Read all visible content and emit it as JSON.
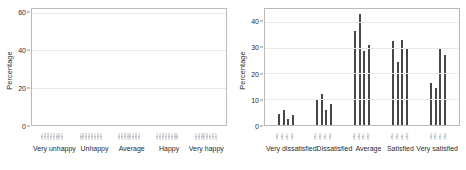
{
  "chart_data": [
    {
      "type": "bar",
      "panel": "left",
      "title": "",
      "xlabel": "",
      "ylabel": "Percentage",
      "ylim": [
        0,
        62
      ],
      "yticks": [
        0,
        20,
        40,
        60
      ],
      "grid": true,
      "legend": "none",
      "categories": [
        "Very unhappy",
        "Unhappy",
        "Average",
        "Happy",
        "Very happy"
      ],
      "bars_per_group": 8,
      "bar_labels": [
        "2002",
        "2003",
        "2004",
        "2005",
        "2006",
        "2007",
        "2008",
        "2009"
      ],
      "groups": [
        {
          "category": "Very unhappy",
          "values": [
            1.0,
            1.5,
            1.2,
            2.5,
            2.2,
            2.0,
            1.5,
            1.3
          ]
        },
        {
          "category": "Unhappy",
          "values": [
            8.6,
            7.6,
            11.7,
            8.7,
            8.1,
            7.2,
            8.4,
            7.0
          ]
        },
        {
          "category": "Average",
          "values": [
            46.0,
            48.0,
            26.5,
            18.3,
            11.1,
            15.8,
            17.8,
            15.0
          ]
        },
        {
          "category": "Happy",
          "values": [
            39.8,
            40.5,
            38.8,
            55.0,
            59.0,
            58.6,
            58.6,
            59.0
          ]
        },
        {
          "category": "Very happy",
          "values": [
            4.2,
            18.8,
            14.8,
            20.0,
            15.5,
            14.2,
            17.0,
            16.8
          ]
        }
      ]
    },
    {
      "type": "bar",
      "panel": "right",
      "title": "",
      "xlabel": "",
      "ylabel": "Percentage",
      "ylim": [
        0,
        45
      ],
      "yticks": [
        0,
        10,
        20,
        30,
        40
      ],
      "grid": true,
      "legend": "none",
      "categories": [
        "Very dissatisfied",
        "Dissatisfied",
        "Average",
        "Satisfied",
        "Very satisfied"
      ],
      "bars_per_group": 5,
      "bar_labels": [
        "2005",
        "2006",
        "2007",
        "2008",
        "2009"
      ],
      "groups": [
        {
          "category": "Very dissatisfied",
          "values": [
            4.2,
            5.8,
            2.5,
            4.0,
            0.0
          ]
        },
        {
          "category": "Dissatisfied",
          "values": [
            10.1,
            12.1,
            6.0,
            8.2,
            0.0
          ]
        },
        {
          "category": "Average",
          "values": [
            36.3,
            43.0,
            28.7,
            31.0,
            0.0
          ]
        },
        {
          "category": "Satisfied",
          "values": [
            32.6,
            24.4,
            33.0,
            29.4,
            0.0
          ]
        },
        {
          "category": "Very satisfied",
          "values": [
            16.2,
            14.2,
            29.6,
            27.0,
            0.0
          ]
        }
      ]
    }
  ]
}
